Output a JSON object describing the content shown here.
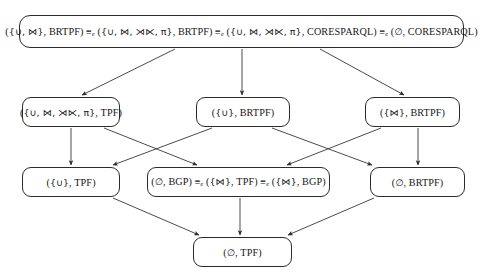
{
  "figure": {
    "type": "hasse-lattice-diagram",
    "background_color": "#ffffff",
    "line_color": "#2b2b2b",
    "text_color": "#161616"
  },
  "nodes": [
    {
      "id": "top",
      "row": 1,
      "label": "({∪, ⋈}, BRTPF) ≡e ({∪, ⋈, ⋊⋉, π}, BRTPF) ≡e ({∪, ⋈, ⋊⋉, π}, CORESPARQL) ≡e (∅, CORESPARQL)",
      "terms": [
        {
          "operators": "{∪, ⋈}",
          "interface": "BRTPF"
        },
        {
          "operators": "{∪, ⋈, ⋊⋉, π}",
          "interface": "BRTPF"
        },
        {
          "operators": "{∪, ⋈, ⋊⋉, π}",
          "interface": "CORESPARQL"
        },
        {
          "operators": "∅",
          "interface": "CORESPARQL"
        }
      ],
      "relation": "≡e"
    },
    {
      "id": "r2-left",
      "row": 2,
      "label": "({∪, ⋈, ⋊⋉, π}, TPF)",
      "terms": [
        {
          "operators": "{∪, ⋈, ⋊⋉, π}",
          "interface": "TPF"
        }
      ]
    },
    {
      "id": "r2-mid",
      "row": 2,
      "label": "({∪}, BRTPF)",
      "terms": [
        {
          "operators": "{∪}",
          "interface": "BRTPF"
        }
      ]
    },
    {
      "id": "r2-right",
      "row": 2,
      "label": "({⋈}, BRTPF)",
      "terms": [
        {
          "operators": "{⋈}",
          "interface": "BRTPF"
        }
      ]
    },
    {
      "id": "r3-left",
      "row": 3,
      "label": "({∪}, TPF)",
      "terms": [
        {
          "operators": "{∪}",
          "interface": "TPF"
        }
      ]
    },
    {
      "id": "r3-mid",
      "row": 3,
      "label": "(∅, BGP) ≡e ({⋈}, TPF) ≡e ({⋈}, BGP)",
      "terms": [
        {
          "operators": "∅",
          "interface": "BGP"
        },
        {
          "operators": "{⋈}",
          "interface": "TPF"
        },
        {
          "operators": "{⋈}",
          "interface": "BGP"
        }
      ],
      "relation": "≡e"
    },
    {
      "id": "r3-right",
      "row": 3,
      "label": "(∅, BRTPF)",
      "terms": [
        {
          "operators": "∅",
          "interface": "BRTPF"
        }
      ]
    },
    {
      "id": "bottom",
      "row": 4,
      "label": "(∅, TPF)",
      "terms": [
        {
          "operators": "∅",
          "interface": "TPF"
        }
      ]
    }
  ],
  "edges": [
    {
      "from": "top",
      "to": "r2-left",
      "style": "solid-arrow"
    },
    {
      "from": "top",
      "to": "r2-mid",
      "style": "solid-arrow"
    },
    {
      "from": "top",
      "to": "r2-right",
      "style": "solid-arrow"
    },
    {
      "from": "r2-left",
      "to": "r3-left",
      "style": "solid-arrow"
    },
    {
      "from": "r2-left",
      "to": "r3-mid",
      "style": "solid-arrow"
    },
    {
      "from": "r2-mid",
      "to": "r3-left",
      "style": "solid-arrow"
    },
    {
      "from": "r2-mid",
      "to": "r3-right",
      "style": "solid-arrow"
    },
    {
      "from": "r2-right",
      "to": "r3-mid",
      "style": "solid-arrow"
    },
    {
      "from": "r2-right",
      "to": "r3-right",
      "style": "solid-arrow"
    },
    {
      "from": "r3-left",
      "to": "bottom",
      "style": "solid-arrow"
    },
    {
      "from": "r3-mid",
      "to": "bottom",
      "style": "solid-arrow"
    },
    {
      "from": "r3-right",
      "to": "bottom",
      "style": "solid-arrow"
    }
  ],
  "symbols": {
    "union": "∪",
    "join": "⋈",
    "left_outer_join": "⋊⋉",
    "projection": "π",
    "empty_set": "∅",
    "equivalence": "≡",
    "equivalence_subscript": "e"
  },
  "interfaces": [
    "TPF",
    "BRTPF",
    "BGP",
    "CORESPARQL"
  ]
}
